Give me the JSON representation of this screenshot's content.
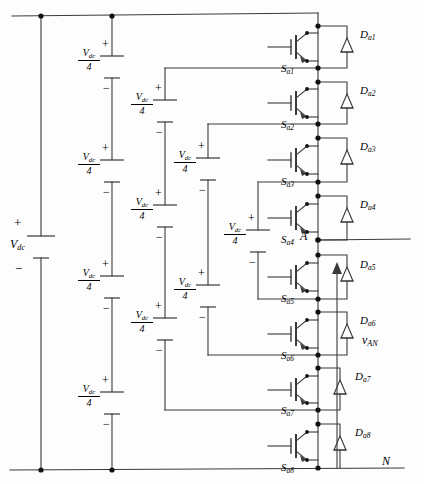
{
  "figure": {
    "type": "circuit-schematic"
  },
  "sources": {
    "main": {
      "label_v": "V",
      "label_sub": "dc",
      "plus": "+",
      "minus": "−"
    },
    "cell_label": {
      "numerator_v": "V",
      "numerator_sub": "dc",
      "denominator": "4",
      "plus": "+",
      "minus": "−"
    },
    "strings": [
      {
        "name": "string-1",
        "count": 4
      },
      {
        "name": "string-2",
        "count": 3
      },
      {
        "name": "string-3",
        "count": 2
      },
      {
        "name": "string-4",
        "count": 1
      }
    ]
  },
  "switches": [
    {
      "id": "Sa1",
      "letter": "S",
      "sub": "a1"
    },
    {
      "id": "Sa2",
      "letter": "S",
      "sub": "a2"
    },
    {
      "id": "Sa3",
      "letter": "S",
      "sub": "a3"
    },
    {
      "id": "Sa4",
      "letter": "S",
      "sub": "a4"
    },
    {
      "id": "Sa5",
      "letter": "S",
      "sub": "a5"
    },
    {
      "id": "Sa6",
      "letter": "S",
      "sub": "a6"
    },
    {
      "id": "Sa7",
      "letter": "S",
      "sub": "a7"
    },
    {
      "id": "Sa8",
      "letter": "S",
      "sub": "a8"
    }
  ],
  "diodes": [
    {
      "id": "Da1",
      "letter": "D",
      "sub": "a1"
    },
    {
      "id": "Da2",
      "letter": "D",
      "sub": "a2"
    },
    {
      "id": "Da3",
      "letter": "D",
      "sub": "a3"
    },
    {
      "id": "Da4",
      "letter": "D",
      "sub": "a4"
    },
    {
      "id": "Da5",
      "letter": "D",
      "sub": "a5"
    },
    {
      "id": "Da6",
      "letter": "D",
      "sub": "a6"
    },
    {
      "id": "Da7",
      "letter": "D",
      "sub": "a7"
    },
    {
      "id": "Da8",
      "letter": "D",
      "sub": "a8"
    }
  ],
  "nodes": {
    "output": "A",
    "neutral": "N"
  },
  "output_voltage": {
    "symbol": "v",
    "sub": "AN"
  },
  "colors": {
    "wire": "#3a3a3a",
    "text": "#000000",
    "background": "#fdfdfd"
  }
}
